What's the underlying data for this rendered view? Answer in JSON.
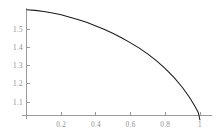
{
  "figure": {
    "background_color": "#ffffff",
    "curve_color": "#1a1a1a",
    "axis_color": "#9a9a9a",
    "label_color": "#8e8e8e"
  },
  "chart_data": {
    "type": "line",
    "title": "",
    "subtitle": "",
    "xlabel": "",
    "ylabel": "",
    "xlim": [
      0.0,
      1.04
    ],
    "ylim": [
      1.0,
      1.62
    ],
    "grid": false,
    "legend": null,
    "legend_position": "none",
    "axis_style": "axes-cross-at-origin",
    "x_ticks": [
      0.2,
      0.4,
      0.6,
      0.8,
      1.0
    ],
    "x_tick_labels": [
      "0.2",
      "0.4",
      "0.6",
      "0.8",
      "1"
    ],
    "y_ticks": [
      1.1,
      1.2,
      1.3,
      1.4,
      1.5
    ],
    "y_tick_labels": [
      "1.1",
      "1.2",
      "1.3",
      "1.4",
      "1.5"
    ],
    "series": [
      {
        "name": "curve",
        "color": "#1a1a1a",
        "x": [
          0.0,
          0.05,
          0.1,
          0.15,
          0.2,
          0.25,
          0.3,
          0.35,
          0.4,
          0.45,
          0.5,
          0.55,
          0.6,
          0.65,
          0.7,
          0.75,
          0.8,
          0.85,
          0.9,
          0.94,
          0.97,
          0.99,
          1.0
        ],
        "y": [
          1.605,
          1.602,
          1.596,
          1.588,
          1.578,
          1.565,
          1.551,
          1.535,
          1.517,
          1.497,
          1.475,
          1.451,
          1.424,
          1.395,
          1.362,
          1.325,
          1.283,
          1.235,
          1.178,
          1.125,
          1.078,
          1.043,
          1.0
        ]
      }
    ]
  }
}
